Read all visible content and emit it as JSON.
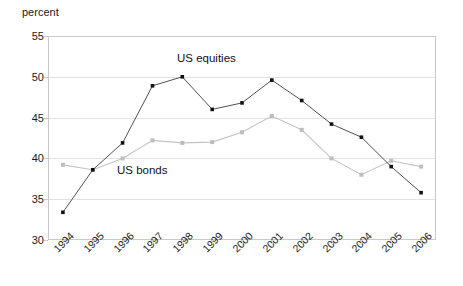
{
  "chart_data": {
    "type": "line",
    "title": "",
    "xlabel": "",
    "ylabel": "percent",
    "ylim": [
      30,
      55
    ],
    "ytick_values": [
      30,
      35,
      40,
      45,
      50,
      55
    ],
    "ytick_labels": [
      "30",
      "35",
      "40",
      "45",
      "50",
      "55"
    ],
    "grid": true,
    "legend_position": "inline-annotations",
    "categories": [
      "1994",
      "1995",
      "1996",
      "1997",
      "1998",
      "1999",
      "2000",
      "2001",
      "2002",
      "2003",
      "2004",
      "2005",
      "2006"
    ],
    "series": [
      {
        "name": "US equities",
        "color": "#3d3d3d",
        "marker": "square-filled-dark",
        "values": [
          33.4,
          38.6,
          41.9,
          48.9,
          50.0,
          46.0,
          46.8,
          49.6,
          47.1,
          44.2,
          42.6,
          39.0,
          35.8
        ]
      },
      {
        "name": "US bonds",
        "color": "#c4c4c4",
        "marker": "square-filled-light",
        "values": [
          39.2,
          38.6,
          40.0,
          42.2,
          41.9,
          42.0,
          43.2,
          45.2,
          43.5,
          40.0,
          38.0,
          39.7,
          39.0
        ]
      }
    ],
    "annotations": [
      {
        "text": "US equities",
        "series": "US equities"
      },
      {
        "text": "US bonds",
        "series": "US bonds"
      }
    ]
  }
}
